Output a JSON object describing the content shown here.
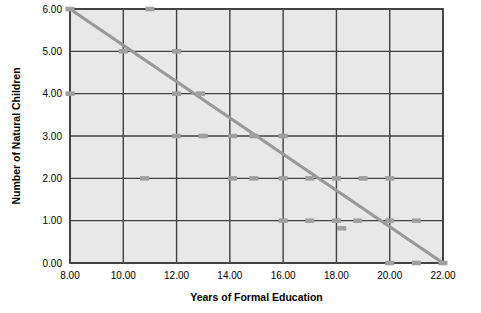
{
  "chart_data": {
    "type": "scatter",
    "title": "",
    "xlabel": "Years of Formal Education",
    "ylabel": "Number of Natural Children",
    "xlim": [
      8,
      22
    ],
    "ylim": [
      0,
      6
    ],
    "xticks": [
      8,
      10,
      12,
      14,
      16,
      18,
      20,
      22
    ],
    "yticks": [
      0,
      1,
      2,
      3,
      4,
      5,
      6
    ],
    "xtick_labels": [
      "8.00",
      "10.00",
      "12.00",
      "14.00",
      "16.00",
      "18.00",
      "20.00",
      "22.00"
    ],
    "ytick_labels": [
      "0.00",
      "1.00",
      "2.00",
      "3.00",
      "4.00",
      "5.00",
      "6.00"
    ],
    "grid": true,
    "legend": false,
    "plot_background": "#e8e8e8",
    "marker_color": "#a0a0a0",
    "line_color": "#999999",
    "axis_color": "#404040",
    "series": [
      {
        "name": "observations",
        "type": "scatter",
        "marker": "square",
        "points": [
          [
            8.0,
            6.0
          ],
          [
            11.0,
            6.0
          ],
          [
            10.0,
            5.0
          ],
          [
            12.0,
            5.0
          ],
          [
            8.0,
            4.0
          ],
          [
            12.0,
            4.0
          ],
          [
            12.9,
            4.0
          ],
          [
            12.0,
            3.0
          ],
          [
            13.0,
            3.0
          ],
          [
            14.1,
            3.0
          ],
          [
            14.9,
            3.0
          ],
          [
            16.0,
            3.0
          ],
          [
            10.8,
            2.0
          ],
          [
            14.1,
            2.0
          ],
          [
            14.9,
            2.0
          ],
          [
            16.0,
            2.0
          ],
          [
            17.0,
            2.0
          ],
          [
            18.0,
            2.0
          ],
          [
            19.0,
            2.0
          ],
          [
            20.0,
            2.0
          ],
          [
            16.0,
            1.0
          ],
          [
            17.0,
            1.0
          ],
          [
            18.0,
            1.0
          ],
          [
            18.8,
            1.0
          ],
          [
            20.0,
            1.0
          ],
          [
            21.0,
            1.0
          ],
          [
            18.2,
            0.82
          ],
          [
            20.0,
            0.0
          ],
          [
            21.0,
            0.0
          ],
          [
            22.0,
            0.0
          ]
        ]
      },
      {
        "name": "regression-line",
        "type": "line",
        "points": [
          [
            8.0,
            6.0
          ],
          [
            22.0,
            0.0
          ]
        ]
      }
    ]
  }
}
